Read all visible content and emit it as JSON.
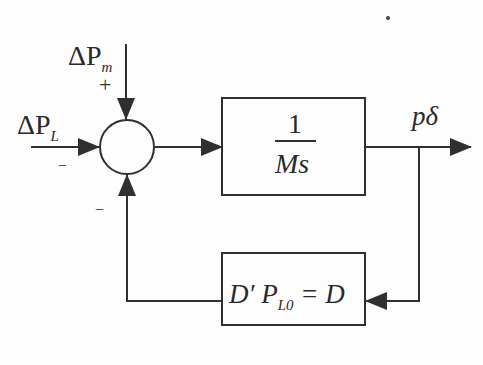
{
  "diagram": {
    "type": "control-block-diagram",
    "inputs": [
      {
        "id": "dPm",
        "symbol": "ΔP",
        "subscript": "m",
        "sign": "+"
      },
      {
        "id": "dPL",
        "symbol": "ΔP",
        "subscript": "L",
        "sign": "−"
      }
    ],
    "summing_junction": {
      "feedback_sign": "−"
    },
    "forward_block": {
      "numerator": "1",
      "denominator": "Ms"
    },
    "output": {
      "label": "pδ"
    },
    "feedback_block": {
      "prefix": "D′ P",
      "subscript": "L0",
      "suffix": "= D"
    },
    "colors": {
      "line": "#2f2f2f",
      "background": "#fdfdfd"
    }
  }
}
